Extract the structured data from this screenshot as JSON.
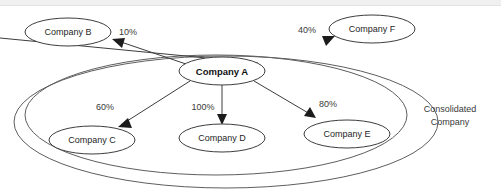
{
  "diagram": {
    "background_color": "#ffffff",
    "node_stroke_color": "#3d3d3d",
    "group_stroke_color": "#5e5e5e",
    "text_color": "#262626",
    "nodes": [
      {
        "id": "A",
        "label": "Company A",
        "bold": true,
        "cx": 222,
        "cy": 71,
        "rx": 43,
        "ry": 14
      },
      {
        "id": "B",
        "label": "Company B",
        "bold": false,
        "cx": 68,
        "cy": 32,
        "rx": 43,
        "ry": 14
      },
      {
        "id": "C",
        "label": "Company C",
        "bold": false,
        "cx": 92,
        "cy": 140,
        "rx": 43,
        "ry": 14
      },
      {
        "id": "D",
        "label": "Company D",
        "bold": false,
        "cx": 222,
        "cy": 138,
        "rx": 43,
        "ry": 14
      },
      {
        "id": "E",
        "label": "Company E",
        "bold": false,
        "cx": 347,
        "cy": 134,
        "rx": 43,
        "ry": 14
      },
      {
        "id": "F",
        "label": "Company F",
        "bold": false,
        "cx": 372,
        "cy": 29,
        "rx": 43,
        "ry": 14
      }
    ],
    "edges": [
      {
        "id": "a-to-b",
        "from": "A",
        "to": "B",
        "percent": "10%",
        "label_x": 128,
        "label_y": 33
      },
      {
        "id": "a-to-f",
        "from": "A",
        "to": "F",
        "percent": "40%",
        "label_x": 307,
        "label_y": 31
      },
      {
        "id": "a-to-c",
        "from": "A",
        "to": "C",
        "percent": "60%",
        "label_x": 105,
        "label_y": 108
      },
      {
        "id": "a-to-d",
        "from": "A",
        "to": "D",
        "percent": "100%",
        "label_x": 203,
        "label_y": 108
      },
      {
        "id": "a-to-e",
        "from": "A",
        "to": "E",
        "percent": "80%",
        "label_x": 328,
        "label_y": 105
      }
    ],
    "groups": [
      {
        "id": "consolidated-inner",
        "label_line1": "Consolidated",
        "label_line2": "Company",
        "label_x": 450,
        "label_y1": 110,
        "label_y2": 123,
        "cx": 218,
        "cy": 117,
        "rx": 189,
        "ry": 67
      },
      {
        "id": "consolidated-outer",
        "cx": 226,
        "cy": 120,
        "rx": 210,
        "ry": 70
      }
    ]
  }
}
